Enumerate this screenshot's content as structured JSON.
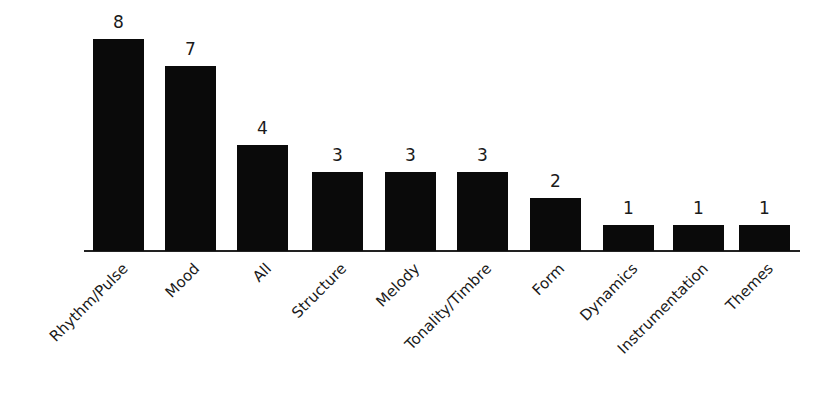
{
  "chart_data": {
    "type": "bar",
    "title": "",
    "xlabel": "",
    "ylabel": "",
    "categories": [
      "Rhythm/Pulse",
      "Mood",
      "All",
      "Structure",
      "Melody",
      "Tonality/Timbre",
      "Form",
      "Dynamics",
      "Instrumentation",
      "Themes"
    ],
    "values": [
      8,
      7,
      4,
      3,
      3,
      3,
      2,
      1,
      1,
      1
    ],
    "data_labels": [
      "8",
      "7",
      "4",
      "3",
      "3",
      "3",
      "2",
      "1",
      "1",
      "1"
    ],
    "ylim": [
      0,
      8
    ],
    "grid": false,
    "legend": null,
    "bar_color": "#0a0a0a",
    "x_tick_rotation": -45
  }
}
